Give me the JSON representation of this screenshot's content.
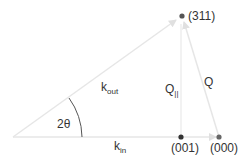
{
  "diagram": {
    "type": "scattering geometry",
    "colors": {
      "arrow": "#e3e3e3",
      "dot": "#555555",
      "text": "#333333",
      "arc": "#555555"
    },
    "points": {
      "p311": {
        "label": "(311)"
      },
      "p001": {
        "label": "(001)"
      },
      "p000": {
        "label": "(000)"
      }
    },
    "vectors": {
      "kout": {
        "main": "k",
        "sub": "out"
      },
      "kin": {
        "main": "k",
        "sub": "in"
      },
      "qpar": {
        "main": "Q",
        "sub": "||"
      },
      "q": {
        "main": "Q"
      }
    },
    "angle": {
      "label": "2θ"
    }
  }
}
